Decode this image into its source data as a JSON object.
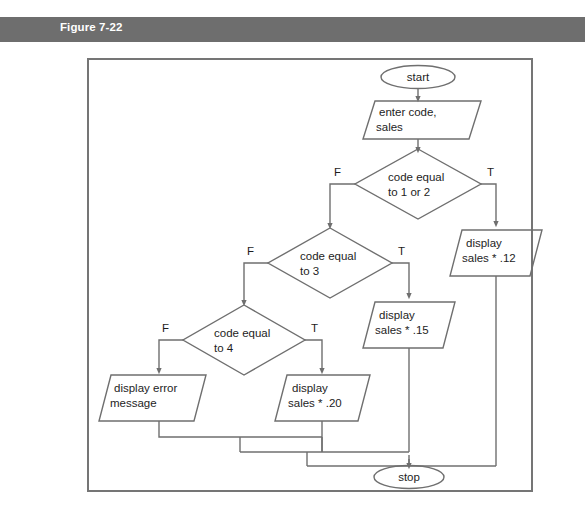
{
  "figure": {
    "header_label": "Figure 7-22",
    "header_color": "#6e6e6e",
    "frame_color": "#757575",
    "line_color": "#6f6f6f",
    "text_color": "#1d1d1d"
  },
  "flowchart": {
    "type": "flowchart",
    "nodes": {
      "start": {
        "shape": "terminator",
        "text": "start"
      },
      "input": {
        "shape": "parallelogram",
        "line1": "enter code,",
        "line2": "sales"
      },
      "decision1": {
        "shape": "diamond",
        "line1": "code equal",
        "line2": "to 1 or 2",
        "true_label": "T",
        "false_label": "F"
      },
      "decision2": {
        "shape": "diamond",
        "line1": "code equal",
        "line2": "to 3",
        "true_label": "T",
        "false_label": "F"
      },
      "decision3": {
        "shape": "diamond",
        "line1": "code equal",
        "line2": "to 4",
        "true_label": "T",
        "false_label": "F"
      },
      "output12": {
        "shape": "parallelogram",
        "line1": "display",
        "line2": "sales * .12"
      },
      "output15": {
        "shape": "parallelogram",
        "line1": "display",
        "line2": "sales * .15"
      },
      "output20": {
        "shape": "parallelogram",
        "line1": "display",
        "line2": "sales * .20"
      },
      "outputerror": {
        "shape": "parallelogram",
        "line1": "display error",
        "line2": "message"
      },
      "stop": {
        "shape": "terminator",
        "text": "stop"
      }
    }
  }
}
